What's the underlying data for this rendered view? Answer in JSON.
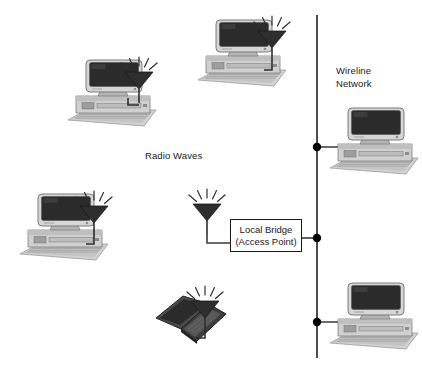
{
  "diagram": {
    "background_color": "#ffffff",
    "width": 422,
    "height": 375,
    "labels": {
      "radio_waves": "Radio Waves",
      "wireline_network_line1": "Wireline",
      "wireline_network_line2": "Network",
      "bridge_line1": "Local Bridge",
      "bridge_line2": "(Access Point)"
    },
    "colors": {
      "line": "#3a3a3a",
      "text": "#1a1a1a",
      "node_dot": "#000000",
      "antenna_fill": "#2e2e2e",
      "monitor_screen": "#2b2b2b",
      "case_light": "#d9d9d9",
      "case_mid": "#bdbdbd",
      "case_dark": "#9a9a9a",
      "laptop_body": "#3d3d3d"
    },
    "nodes": [
      {
        "id": "wireless-pc-top-left",
        "type": "desktop-computer",
        "x": 66,
        "y": 58,
        "has_antenna": true
      },
      {
        "id": "wireless-pc-top-center",
        "type": "desktop-computer",
        "x": 196,
        "y": 18,
        "has_antenna": true
      },
      {
        "id": "wireless-pc-middle-left",
        "type": "desktop-computer",
        "x": 18,
        "y": 192,
        "has_antenna": true
      },
      {
        "id": "wireless-laptop-bottom",
        "type": "laptop-computer",
        "x": 150,
        "y": 294,
        "has_antenna": true
      },
      {
        "id": "wired-pc-upper-right",
        "type": "desktop-computer",
        "x": 328,
        "y": 106,
        "has_antenna": false
      },
      {
        "id": "wired-pc-lower-right",
        "type": "desktop-computer",
        "x": 328,
        "y": 281,
        "has_antenna": false
      },
      {
        "id": "access-point-antenna",
        "type": "antenna",
        "x": 187,
        "y": 189,
        "has_antenna": true
      }
    ],
    "backbone": {
      "orientation": "vertical",
      "x": 317,
      "y_start": 15,
      "y_end": 358,
      "junction_dots_y": [
        147,
        238,
        322
      ]
    }
  }
}
